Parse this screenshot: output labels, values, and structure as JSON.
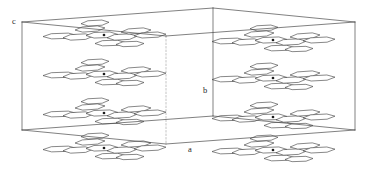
{
  "figure": {
    "kind": "crystal-packing-diagram",
    "background_color": "#ffffff",
    "line_color": "#4a4a4a",
    "hidden_line_color": "#9a9a9a",
    "molecule_outline_color": "#3d3d3d",
    "molecule_fill_color": "#ffffff",
    "center_dot_color": "#1a1a1a",
    "width": 372,
    "height": 174
  },
  "axes": {
    "labels": [
      {
        "name": "c",
        "text": "c",
        "x": 14,
        "y": 24
      },
      {
        "name": "b",
        "text": "b",
        "x": 205,
        "y": 93
      },
      {
        "name": "a",
        "text": "a",
        "x": 190,
        "y": 152
      }
    ]
  },
  "unit_cell": {
    "description": "Parallelepiped wireframe outline of the crystallographic unit cell drawn in oblique projection",
    "vertices": {
      "front_top_left": [
        22,
        22
      ],
      "front_top_right": [
        213,
        8
      ],
      "back_top_right": [
        355,
        22
      ],
      "back_top_left": [
        166,
        36
      ],
      "front_bottom_left": [
        22,
        130
      ],
      "front_bottom_right": [
        213,
        116
      ],
      "back_bottom_right": [
        355,
        130
      ],
      "back_bottom_left": [
        166,
        144
      ]
    },
    "solid_edges": [
      [
        [
          22,
          22
        ],
        [
          213,
          8
        ]
      ],
      [
        [
          213,
          8
        ],
        [
          355,
          22
        ]
      ],
      [
        [
          22,
          22
        ],
        [
          22,
          130
        ]
      ],
      [
        [
          213,
          8
        ],
        [
          213,
          116
        ]
      ],
      [
        [
          355,
          22
        ],
        [
          355,
          130
        ]
      ],
      [
        [
          22,
          130
        ],
        [
          213,
          116
        ]
      ],
      [
        [
          213,
          116
        ],
        [
          355,
          130
        ]
      ],
      [
        [
          22,
          22
        ],
        [
          166,
          36
        ]
      ],
      [
        [
          166,
          36
        ],
        [
          355,
          22
        ]
      ],
      [
        [
          22,
          130
        ],
        [
          166,
          144
        ]
      ],
      [
        [
          166,
          144
        ],
        [
          355,
          130
        ]
      ]
    ],
    "hidden_edges": [
      [
        [
          166,
          36
        ],
        [
          166,
          144
        ]
      ]
    ]
  },
  "molecules": {
    "count": 8,
    "type": "flat polycyclic aromatic molecule",
    "sites": [
      {
        "name": "molecule-top-left-front",
        "cx": 104,
        "cy": 35,
        "scale": 1.0
      },
      {
        "name": "molecule-top-right-front",
        "cx": 273,
        "cy": 40,
        "scale": 1.0
      },
      {
        "name": "molecule-mid-left",
        "cx": 104,
        "cy": 74,
        "scale": 1.0
      },
      {
        "name": "molecule-mid-right",
        "cx": 273,
        "cy": 78,
        "scale": 1.0
      },
      {
        "name": "molecule-low-left",
        "cx": 104,
        "cy": 113,
        "scale": 1.0
      },
      {
        "name": "molecule-low-right",
        "cx": 273,
        "cy": 117,
        "scale": 1.0
      },
      {
        "name": "molecule-bottom-left",
        "cx": 104,
        "cy": 148,
        "scale": 1.0
      },
      {
        "name": "molecule-bottom-right",
        "cx": 273,
        "cy": 150,
        "scale": 1.0
      }
    ],
    "ring_template": {
      "description": "Each molecule is drawn as a cluster of strongly foreshortened hexagonal rings fanning out from a central inversion-centre dot",
      "rings": [
        {
          "dx": -44,
          "dy": 1,
          "rx": 17,
          "ry": 3.0,
          "rot": -2
        },
        {
          "dx": -26,
          "dy": 2,
          "rx": 15,
          "ry": 3.2,
          "rot": -3
        },
        {
          "dx": -14,
          "dy": -6,
          "rx": 15,
          "ry": 3.0,
          "rot": -4
        },
        {
          "dx": -9,
          "dy": -12,
          "rx": 14,
          "ry": 3.0,
          "rot": -3
        },
        {
          "dx": -2,
          "dy": 0,
          "rx": 16,
          "ry": 3.2,
          "rot": -2
        },
        {
          "dx": 6,
          "dy": 8,
          "rx": 15,
          "ry": 3.0,
          "rot": -2
        },
        {
          "dx": 18,
          "dy": 2,
          "rx": 15,
          "ry": 3.2,
          "rot": -3
        },
        {
          "dx": 32,
          "dy": -4,
          "rx": 15,
          "ry": 3.0,
          "rot": -4
        },
        {
          "dx": 46,
          "dy": 0,
          "rx": 16,
          "ry": 3.0,
          "rot": -3
        },
        {
          "dx": 26,
          "dy": 9,
          "rx": 14,
          "ry": 2.8,
          "rot": -2
        }
      ]
    }
  }
}
